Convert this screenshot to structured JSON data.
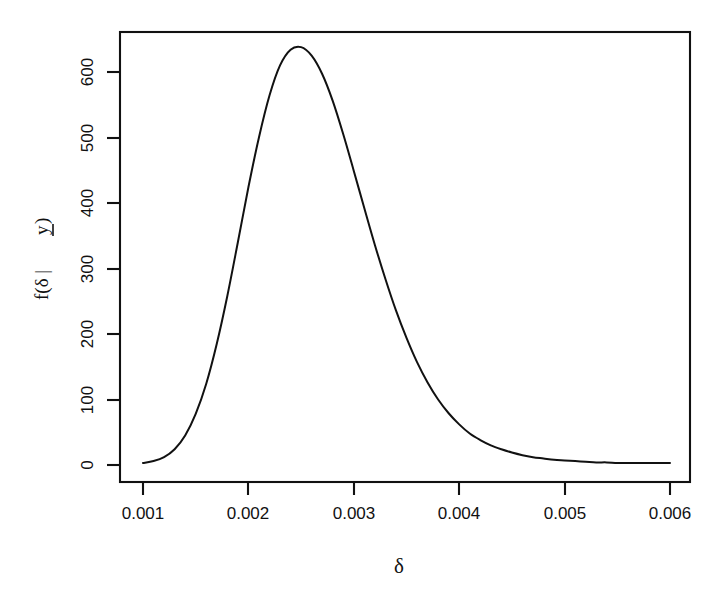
{
  "figure": {
    "background_color": "#ffffff",
    "foreground_color": "#111111",
    "width": 728,
    "height": 595
  },
  "axis": {
    "x_title": "δ",
    "y_title_prefix": "f(δ | ",
    "y_title_vector": "y",
    "y_title_suffix": ")",
    "x_tick_labels": [
      "0.001",
      "0.002",
      "0.003",
      "0.004",
      "0.005",
      "0.006"
    ],
    "y_tick_labels": [
      "0",
      "100",
      "200",
      "300",
      "400",
      "500",
      "600"
    ]
  },
  "chart_data": {
    "type": "line",
    "title": "",
    "subtitle": "",
    "xlabel": "δ",
    "ylabel": "f(δ | y)",
    "xlim": [
      0.001,
      0.006
    ],
    "ylim": [
      0,
      640
    ],
    "xticks": [
      0.001,
      0.002,
      0.003,
      0.004,
      0.005,
      0.006
    ],
    "yticks": [
      0,
      100,
      200,
      300,
      400,
      500,
      600
    ],
    "grid": false,
    "legend": "none",
    "annotations": [],
    "series": [
      {
        "name": "posterior density of delta",
        "x": [
          0.001,
          0.0011,
          0.0012,
          0.0013,
          0.0014,
          0.0015,
          0.0016,
          0.0017,
          0.0018,
          0.0019,
          0.002,
          0.0021,
          0.0022,
          0.0023,
          0.0024,
          0.0025,
          0.0026,
          0.0027,
          0.0028,
          0.0029,
          0.003,
          0.0031,
          0.0032,
          0.0033,
          0.0034,
          0.0035,
          0.0036,
          0.0037,
          0.0038,
          0.0039,
          0.004,
          0.0041,
          0.0042,
          0.0043,
          0.0044,
          0.0045,
          0.0046,
          0.0047,
          0.0048,
          0.0049,
          0.005,
          0.0051,
          0.0052,
          0.0053,
          0.0054,
          0.0055,
          0.0056,
          0.0057,
          0.0058,
          0.0059,
          0.006
        ],
        "y": [
          3,
          6,
          12,
          24,
          45,
          78,
          124,
          185,
          258,
          340,
          424,
          500,
          564,
          610,
          634,
          638,
          625,
          597,
          556,
          505,
          449,
          392,
          336,
          284,
          236,
          194,
          157,
          126,
          100,
          79,
          62,
          48,
          38,
          30,
          24,
          19,
          15,
          12,
          10,
          8,
          7,
          6,
          5,
          4,
          4,
          3,
          3,
          3,
          3,
          3,
          3
        ],
        "color": "#111111",
        "line_width": 2
      }
    ],
    "peak": {
      "x": 0.0026,
      "y": 638
    }
  }
}
